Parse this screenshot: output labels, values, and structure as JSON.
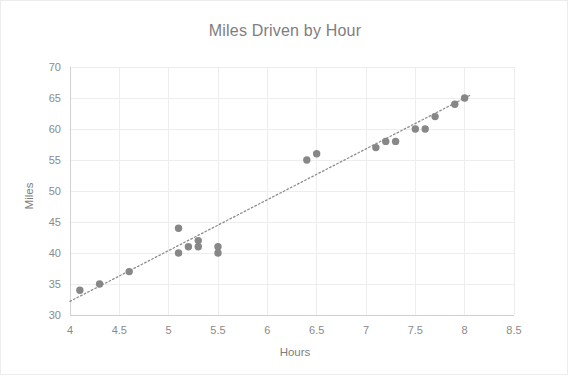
{
  "chart_data": {
    "type": "scatter",
    "title": "Miles Driven by Hour",
    "xlabel": "Hours",
    "ylabel": "Miles",
    "xlim": [
      4,
      8.5
    ],
    "ylim": [
      30,
      70
    ],
    "xticks": [
      "4",
      "4.5",
      "5",
      "5.5",
      "6",
      "6.5",
      "7",
      "7.5",
      "8",
      "8.5"
    ],
    "xtick_values": [
      4,
      4.5,
      5,
      5.5,
      6,
      6.5,
      7,
      7.5,
      8,
      8.5
    ],
    "yticks": [
      "30",
      "35",
      "40",
      "45",
      "50",
      "55",
      "60",
      "65",
      "70"
    ],
    "ytick_values": [
      30,
      35,
      40,
      45,
      50,
      55,
      60,
      65,
      70
    ],
    "grid": true,
    "legend": "none",
    "series": [
      {
        "name": "Miles",
        "marker": "circle",
        "color": "#878787",
        "x": [
          4.1,
          4.3,
          4.6,
          5.1,
          5.1,
          5.2,
          5.3,
          5.3,
          5.5,
          5.5,
          6.4,
          6.5,
          7.1,
          7.2,
          7.3,
          7.5,
          7.6,
          7.7,
          7.9,
          8.0
        ],
        "y": [
          34,
          35,
          37,
          44,
          40,
          41,
          42,
          41,
          41,
          40,
          55,
          56,
          57,
          58,
          58,
          60,
          60,
          62,
          64,
          65
        ]
      }
    ],
    "trendline": {
      "type": "linear-dotted",
      "color": "#8d8d8d",
      "x_start": 4.0,
      "y_start": 32.2,
      "x_end": 8.05,
      "y_end": 65.4
    }
  }
}
